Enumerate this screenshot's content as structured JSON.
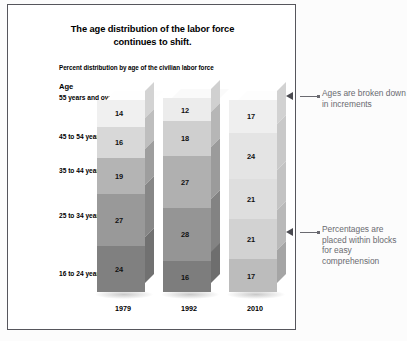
{
  "chart_data": {
    "type": "bar",
    "subtype": "stacked-100-percent-3d",
    "title": "The age distribution of the labor force continues to shift.",
    "title_line1": "The age distribution of the labor force",
    "title_line2": "continues to shift.",
    "subtitle": "Percent distribution by age of the civilian labor force",
    "xlabel": "",
    "ylabel": "",
    "axis_header": "Age",
    "categories": [
      "1979",
      "1992",
      "2010"
    ],
    "grid": false,
    "legend": "none",
    "stack_order": "top-to-bottom",
    "series": [
      {
        "name": "55 years and over",
        "values": [
          14,
          12,
          17
        ]
      },
      {
        "name": "45 to 54 years",
        "values": [
          16,
          18,
          24
        ]
      },
      {
        "name": "35 to 44 years",
        "values": [
          19,
          27,
          21
        ]
      },
      {
        "name": "25 to 34 years",
        "values": [
          27,
          28,
          21
        ]
      },
      {
        "name": "16 to 24 years",
        "values": [
          24,
          16,
          17
        ]
      }
    ],
    "bars": [
      {
        "year": "1979",
        "total": 100,
        "segments": [
          {
            "group": "55 years and over",
            "value": 14,
            "color": "#f0f0f0"
          },
          {
            "group": "45 to 54 years",
            "value": 16,
            "color": "#d8d8d8"
          },
          {
            "group": "35 to 44 years",
            "value": 19,
            "color": "#b4b4b4"
          },
          {
            "group": "25 to 34 years",
            "value": 27,
            "color": "#999999"
          },
          {
            "group": "16 to 24 years",
            "value": 24,
            "color": "#808080"
          }
        ]
      },
      {
        "year": "1992",
        "total": 101,
        "segments": [
          {
            "group": "55 years and over",
            "value": 12,
            "color": "#ececec"
          },
          {
            "group": "45 to 54 years",
            "value": 18,
            "color": "#cfcfcf"
          },
          {
            "group": "35 to 44 years",
            "value": 27,
            "color": "#b0b0b0"
          },
          {
            "group": "25 to 34 years",
            "value": 28,
            "color": "#959595"
          },
          {
            "group": "16 to 24 years",
            "value": 16,
            "color": "#7d7d7d"
          }
        ]
      },
      {
        "year": "2010",
        "total": 100,
        "segments": [
          {
            "group": "55 years and over",
            "value": 17,
            "color": "#efefef"
          },
          {
            "group": "45 to 54 years",
            "value": 24,
            "color": "#e4e4e4"
          },
          {
            "group": "35 to 44 years",
            "value": 21,
            "color": "#dedede"
          },
          {
            "group": "25 to 34 years",
            "value": 21,
            "color": "#d2d2d2"
          },
          {
            "group": "16 to 24 years",
            "value": 17,
            "color": "#bcbcbc"
          }
        ]
      }
    ]
  },
  "age_labels": [
    {
      "text": "55 years and over"
    },
    {
      "text": "45 to 54 years"
    },
    {
      "text": "35 to 44 years"
    },
    {
      "text": "25 to 34 years"
    },
    {
      "text": "16 to 24 years"
    }
  ],
  "annotations": [
    {
      "id": "ages-broken-down",
      "text": "Ages are broken down in increments"
    },
    {
      "id": "percentages-in-blocks",
      "text": "Percentages are placed within blocks for easy comprehension"
    }
  ],
  "colors": {
    "panel_background": "#ffffff",
    "panel_border": "#56565c",
    "page_background": "#fcfcfc",
    "annotation_text": "#6a6a70",
    "annotation_arrow": "#4a4a50",
    "text": "#000000"
  }
}
